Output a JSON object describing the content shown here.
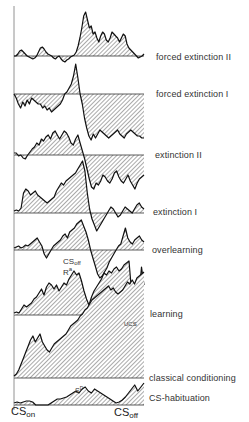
{
  "chart_data": {
    "type": "area",
    "title": "",
    "xlabel": "",
    "ylabel": "",
    "x_range": {
      "start_label": "CS_on",
      "end_label": "CS_off"
    },
    "grid": false,
    "legend": "none (each trace labeled at right)",
    "annotations": [
      {
        "text": "CS_off",
        "near": "overlearning",
        "position": "below dip at mid-trace"
      },
      {
        "text": "R^a",
        "near": "overlearning/learning",
        "position": "below CS_off label"
      },
      {
        "text": "UCS",
        "near": "classical conditioning",
        "position": "end of trace"
      },
      {
        "text": "S^D",
        "near": "CS-habituation",
        "position": "mid-trace"
      }
    ],
    "series": [
      {
        "name": "forced extinction II",
        "baseline_y": 56,
        "values": [
          0,
          0,
          2,
          5,
          6,
          4,
          2,
          0,
          -1,
          -2,
          -3,
          -2,
          0,
          4,
          8,
          9,
          7,
          4,
          2,
          1,
          0,
          -2,
          -3,
          -1,
          0,
          -3,
          -5,
          -6,
          -4,
          -3,
          -1,
          0,
          1,
          4,
          10,
          18,
          28,
          40,
          44,
          36,
          28,
          30,
          22,
          24,
          18,
          14,
          20,
          24,
          22,
          16,
          14,
          18,
          24,
          22,
          20,
          18,
          14,
          18,
          22,
          20,
          12,
          8,
          6,
          4,
          2,
          0,
          -2,
          -1,
          0,
          2
        ]
      },
      {
        "name": "forced extinction I",
        "baseline_y": 94,
        "values": [
          0,
          -4,
          -10,
          -14,
          -8,
          -12,
          -6,
          -10,
          -4,
          -6,
          -8,
          -10,
          -10,
          -14,
          -12,
          -16,
          -14,
          -18,
          -16,
          -14,
          -12,
          -10,
          -6,
          0,
          2,
          6,
          10,
          18,
          30,
          16,
          0,
          -10,
          -24,
          -34,
          -42,
          -46,
          -40,
          -44,
          -40,
          -36,
          -38,
          -40,
          -42,
          -44,
          -42,
          -40,
          -38,
          -36,
          -40,
          -42,
          -44,
          -40,
          -38,
          -36,
          -38,
          -40,
          -42,
          -42,
          -44,
          -44
        ]
      },
      {
        "name": "extinction II",
        "baseline_y": 155,
        "values": [
          2,
          2,
          -1,
          0,
          -3,
          -4,
          0,
          3,
          6,
          8,
          12,
          10,
          16,
          14,
          18,
          20,
          16,
          22,
          24,
          20,
          16,
          20,
          24,
          22,
          18,
          12,
          10,
          16,
          20,
          12,
          4,
          -4,
          -14,
          -24,
          -32,
          -34,
          -28,
          -30,
          -26,
          -20,
          -22,
          -26,
          -28,
          -24,
          -18,
          -16,
          -22,
          -26,
          -28,
          -24,
          -20,
          -26,
          -30,
          -34,
          -28,
          -24,
          -22,
          -20
        ]
      },
      {
        "name": "extinction I",
        "baseline_y": 213,
        "values": [
          2,
          3,
          2,
          5,
          20,
          24,
          22,
          18,
          20,
          22,
          18,
          16,
          14,
          12,
          10,
          12,
          14,
          16,
          22,
          26,
          30,
          28,
          32,
          34,
          36,
          38,
          40,
          44,
          48,
          52,
          42,
          20,
          4,
          -6,
          -12,
          -18,
          -14,
          -10,
          -6,
          -2,
          2,
          6,
          4,
          0,
          -4,
          -2,
          2,
          6,
          4,
          2,
          0,
          4,
          8,
          10,
          6,
          4
        ]
      },
      {
        "name": "overlearning",
        "baseline_y": 250,
        "values": [
          2,
          3,
          4,
          2,
          3,
          5,
          4,
          6,
          8,
          10,
          12,
          8,
          4,
          -4,
          -8,
          -4,
          0,
          4,
          6,
          8,
          10,
          14,
          16,
          12,
          18,
          20,
          22,
          26,
          28,
          30,
          24,
          18,
          10,
          0,
          -8,
          -16,
          -24,
          -28,
          -26,
          -22,
          -18,
          -12,
          -8,
          -4,
          0,
          4,
          6,
          14,
          22,
          12,
          8,
          6,
          10,
          12,
          14,
          10,
          8
        ]
      },
      {
        "name": "learning",
        "baseline_y": 315,
        "values": [
          2,
          3,
          2,
          6,
          10,
          8,
          10,
          12,
          16,
          18,
          22,
          26,
          20,
          28,
          32,
          30,
          26,
          30,
          24,
          28,
          32,
          30,
          36,
          40,
          44,
          40,
          42,
          34,
          24,
          16,
          10,
          18,
          24,
          28,
          32,
          36,
          42,
          40,
          44,
          42,
          46,
          48,
          44,
          46,
          50,
          52,
          54,
          24,
          10,
          12,
          20,
          48,
          30
        ]
      },
      {
        "name": "classical conditioning",
        "baseline_y": 378,
        "values": [
          2,
          4,
          8,
          14,
          20,
          26,
          32,
          38,
          42,
          36,
          40,
          44,
          36,
          32,
          28,
          26,
          30,
          34,
          36,
          38,
          40,
          42,
          44,
          48,
          52,
          54,
          56,
          58,
          62,
          64,
          68,
          70,
          74,
          78,
          80,
          82,
          84,
          86,
          88,
          90,
          92,
          88,
          90,
          86,
          84,
          86,
          88,
          92,
          96,
          94,
          98,
          94,
          100,
          102,
          104,
          106
        ]
      },
      {
        "name": "CS-habituation",
        "baseline_y": 405,
        "values": [
          2,
          3,
          2,
          3,
          4,
          4,
          3,
          0,
          0,
          0,
          0,
          0,
          2,
          4,
          6,
          6,
          7,
          8,
          10,
          12,
          14,
          12,
          16,
          18,
          14,
          12,
          16,
          14,
          12,
          10,
          8,
          6,
          4,
          2,
          3,
          5,
          8,
          12,
          16,
          20,
          14,
          18,
          22
        ]
      }
    ]
  },
  "labels": {
    "forced_extinction_2": "forced extinction II",
    "forced_extinction_1": "forced extinction I",
    "extinction_2": "extinction II",
    "extinction_1": "extinction I",
    "overlearning": "overlearning",
    "learning": "learning",
    "classical_conditioning": "classical conditioning",
    "cs_habituation": "CS-habituation"
  },
  "annotations": {
    "cs_off_base": "CS",
    "cs_off_sub": "off",
    "ra_base": "R",
    "ra_sup": "a",
    "ucs": "UCS",
    "sd_base": "S",
    "sd_sup": "D"
  },
  "axis": {
    "cs_on_base": "CS",
    "cs_on_sub": "on",
    "cs_off_base": "CS",
    "cs_off_sub": "off"
  }
}
